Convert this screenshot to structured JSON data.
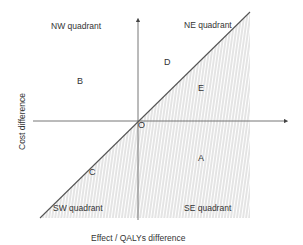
{
  "diagram": {
    "type": "cost-effectiveness plane",
    "x_axis_label": "Effect / QALYs difference",
    "y_axis_label": "Cost difference",
    "origin_label": "O",
    "quadrants": {
      "nw": "NW quadrant",
      "ne": "NE quadrant",
      "sw": "SW quadrant",
      "se": "SE quadrant"
    },
    "points": {
      "a": "A",
      "b": "B",
      "c": "C",
      "d": "D",
      "e": "E"
    },
    "colors": {
      "axis": "#555555",
      "threshold_line": "#555555",
      "hatch": "#bdbdbd"
    }
  }
}
